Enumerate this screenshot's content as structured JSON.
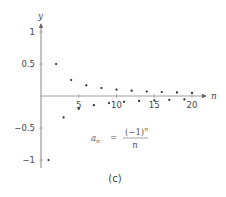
{
  "chart_data": {
    "type": "scatter",
    "title": "",
    "xlabel": "n",
    "ylabel": "y",
    "xlim": [
      0,
      21
    ],
    "ylim": [
      -1,
      1
    ],
    "x_ticks": [
      5,
      10,
      15,
      20
    ],
    "x_tick_labels": [
      "5",
      "10",
      "15",
      "20"
    ],
    "y_ticks": [
      1,
      0.5,
      -0.5,
      -1
    ],
    "y_tick_labels": [
      "1",
      "0.5",
      "−0.5",
      "−1"
    ],
    "grid": false,
    "annotation": "a_n = (−1)^n / n",
    "caption": "(c)",
    "series": [
      {
        "name": "a_n",
        "x": [
          1,
          2,
          3,
          4,
          5,
          6,
          7,
          8,
          9,
          10,
          11,
          12,
          13,
          14,
          15,
          16,
          17,
          18,
          19,
          20
        ],
        "values": [
          -1,
          0.5,
          -0.333,
          0.25,
          -0.2,
          0.167,
          -0.143,
          0.125,
          -0.111,
          0.1,
          -0.091,
          0.083,
          -0.077,
          0.071,
          -0.067,
          0.063,
          -0.059,
          0.056,
          -0.053,
          0.05
        ]
      }
    ]
  },
  "labels": {
    "x_axis": "n",
    "y_axis": "y",
    "formula_lhs_base": "a",
    "formula_lhs_sub": "n",
    "formula_eq": "=",
    "formula_num": "(−1)",
    "formula_num_exp": "n",
    "formula_den": "n",
    "caption": "(c)",
    "xt5": "5",
    "xt10": "10",
    "xt15": "15",
    "xt20": "20",
    "yt1": "1",
    "yt05": "0.5",
    "ytm05": "−0.5",
    "ytm1": "−1"
  },
  "colors": {
    "axis": "#666666",
    "point": "#222222"
  }
}
